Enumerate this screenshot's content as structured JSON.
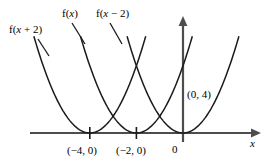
{
  "chart_data": {
    "type": "line",
    "title": "",
    "xlabel": "x",
    "ylabel": "",
    "grid": false,
    "legend_position": "inline-curve-labels",
    "xlim": [
      -6.2,
      3.2
    ],
    "ylim": [
      -0.6,
      6.4
    ],
    "series": [
      {
        "name": "f(x + 2)",
        "equation": "y = (x + 4)^2",
        "vertex": [
          -4,
          0
        ],
        "x": [
          -6.2,
          -5.8,
          -5.4,
          -5.0,
          -4.6,
          -4.2,
          -4.0,
          -3.8,
          -3.4,
          -3.0,
          -2.6,
          -2.2,
          -1.9
        ],
        "values": [
          4.84,
          3.24,
          1.96,
          1.0,
          0.36,
          0.04,
          0.0,
          0.04,
          0.36,
          1.0,
          1.96,
          3.24,
          4.41
        ]
      },
      {
        "name": "f(x)",
        "equation": "y = (x + 2)^2",
        "vertex": [
          -2,
          0
        ],
        "x": [
          -4.6,
          -4.2,
          -3.8,
          -3.4,
          -3.0,
          -2.6,
          -2.2,
          -2.0,
          -1.8,
          -1.4,
          -1.0,
          -0.6,
          -0.2,
          0.1
        ],
        "values": [
          6.76,
          4.84,
          3.24,
          1.96,
          1.0,
          0.36,
          0.04,
          0.0,
          0.04,
          0.36,
          1.0,
          1.96,
          3.24,
          4.41
        ]
      },
      {
        "name": "f(x - 2)",
        "equation": "y = x^2",
        "vertex": [
          0,
          0
        ],
        "x": [
          -2.6,
          -2.2,
          -1.8,
          -1.4,
          -1.0,
          -0.6,
          -0.2,
          0.0,
          0.2,
          0.6,
          1.0,
          1.4,
          1.8,
          2.2,
          2.5
        ],
        "values": [
          6.76,
          4.84,
          3.24,
          1.96,
          1.0,
          0.36,
          0.04,
          0.0,
          0.04,
          0.36,
          1.0,
          1.96,
          3.24,
          4.84,
          6.25
        ]
      }
    ],
    "annotations": [
      {
        "text": "(0, 4)",
        "x": 0,
        "y": 4
      },
      {
        "text": "(-4, 0)",
        "x": -4,
        "y": 0
      },
      {
        "text": "(-2, 0)",
        "x": -2,
        "y": 0
      },
      {
        "text": "0",
        "x": 0,
        "y": 0
      }
    ],
    "x_ticks": [
      -4,
      -2
    ],
    "axis_color": "#4d4d4d",
    "curve_color": "#1a1a1a"
  },
  "labels": {
    "curve_left": {
      "prefix": "f(",
      "variable": "x",
      "suffix": " + 2)"
    },
    "curve_middle": {
      "prefix": "f(",
      "variable": "x",
      "suffix": ")"
    },
    "curve_right": {
      "prefix": "f(",
      "variable": "x",
      "suffix": " − 2)"
    },
    "point_0_4": "(0, 4)",
    "tick_minus4": "(−4, 0)",
    "tick_minus2": "(−2, 0)",
    "origin": "0",
    "axis_x": "x"
  }
}
